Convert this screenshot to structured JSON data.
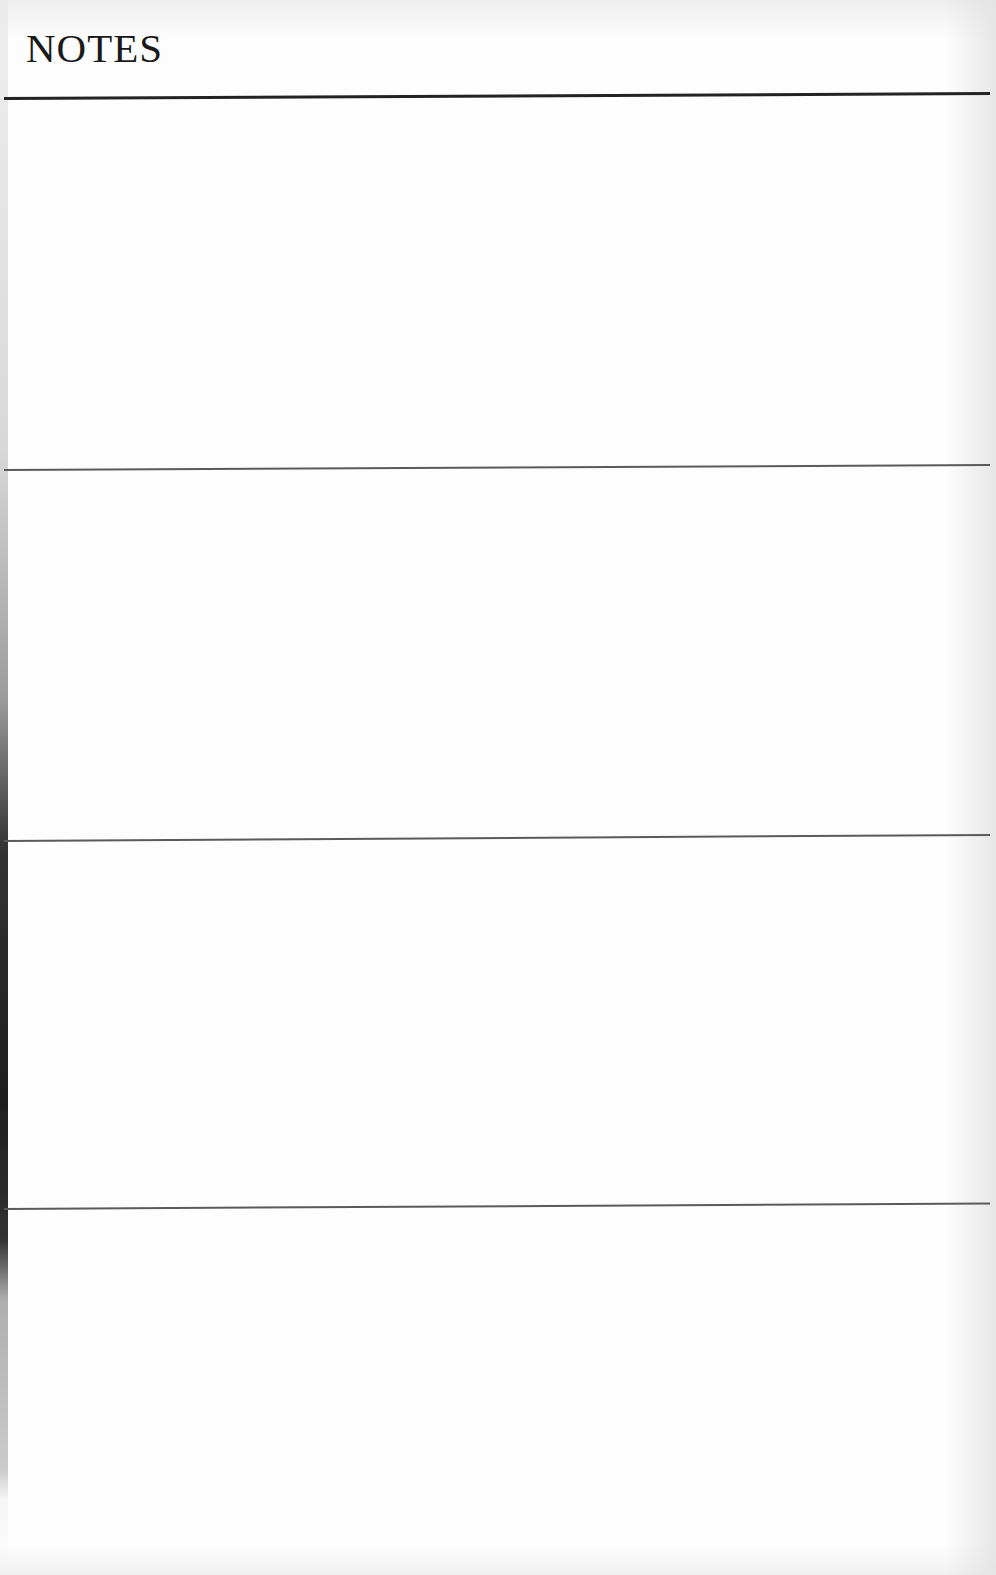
{
  "page": {
    "title": "NOTES",
    "sections": [
      {
        "index": 1,
        "content": ""
      },
      {
        "index": 2,
        "content": ""
      },
      {
        "index": 3,
        "content": ""
      },
      {
        "index": 4,
        "content": ""
      }
    ]
  },
  "colors": {
    "heading": "#1a1a1a",
    "heavy_rule": "#222222",
    "thin_rule": "#5a5a5a",
    "paper": "#fdfdfd"
  }
}
